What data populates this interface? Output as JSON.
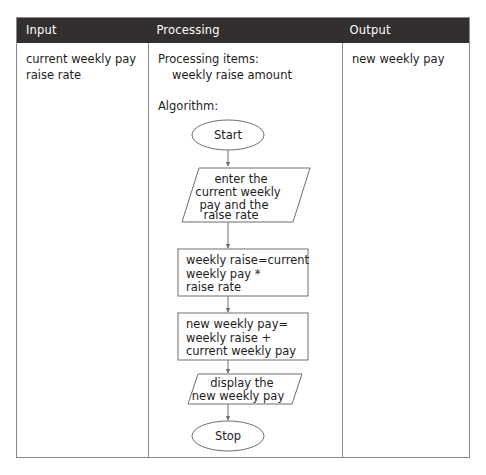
{
  "table": {
    "columns": [
      {
        "key": "input",
        "header": "Input"
      },
      {
        "key": "processing",
        "header": "Processing"
      },
      {
        "key": "output",
        "header": "Output"
      }
    ],
    "header_bg": "#332f2f",
    "header_text_color": "#ffffff",
    "border_color": "#8a8a8a",
    "cells": {
      "input": {
        "line1": "current weekly pay",
        "line2": "raise rate"
      },
      "processing": {
        "line1": "Processing items:",
        "line2": "weekly raise amount",
        "line3": "Algorithm:"
      },
      "output": {
        "line1": "new weekly pay"
      }
    }
  },
  "flowchart": {
    "shape_stroke": "#6e6e6e",
    "shape_fill": "#ffffff",
    "nodes": {
      "start": {
        "type": "terminator",
        "label": "Start"
      },
      "input_step": {
        "type": "parallelogram",
        "line1": "enter the",
        "line2": "current weekly",
        "line3": "pay and the",
        "line4": "raise rate"
      },
      "process_1": {
        "type": "process",
        "line1": "weekly raise=current",
        "line2": "weekly pay *",
        "line3": "raise rate"
      },
      "process_2": {
        "type": "process",
        "line1": "new weekly pay=",
        "line2": "weekly raise +",
        "line3": "current weekly pay"
      },
      "output_step": {
        "type": "parallelogram",
        "line1": "display the",
        "line2": "new weekly pay"
      },
      "stop": {
        "type": "terminator",
        "label": "Stop"
      }
    }
  }
}
